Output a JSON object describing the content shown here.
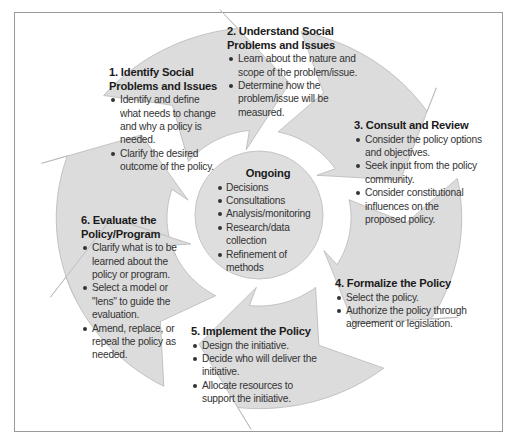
{
  "diagram": {
    "colors": {
      "arrow_fill": "#dcdcdc",
      "arrow_stroke": "#b8b8b8",
      "center_fill": "#dedede",
      "frame_border": "#9a9a9a",
      "text": "#333333",
      "heading": "#1a1a1a"
    },
    "center": {
      "title": "Ongoing",
      "items": [
        "Decisions",
        "Consultations",
        "Analysis/monitoring",
        "Research/data collection",
        "Refinement of methods"
      ]
    },
    "steps": [
      {
        "title": "1. Identify Social Problems and Issues",
        "items": [
          "Identify and define what needs to change and why a policy is needed.",
          "Clarify the desired outcome of the policy."
        ]
      },
      {
        "title": "2. Understand Social Problems and Issues",
        "items": [
          "Learn about the nature and scope of the problem/issue.",
          "Determine how the problem/issue will be measured."
        ]
      },
      {
        "title": "3. Consult and Review",
        "items": [
          "Consider the policy options and objectives.",
          "Seek input from the policy community.",
          "Consider constitutional influences on the proposed policy."
        ]
      },
      {
        "title": "4. Formalize the Policy",
        "items": [
          "Select the policy.",
          "Authorize the policy through agreement or legislation."
        ]
      },
      {
        "title": "5. Implement the Policy",
        "items": [
          "Design the initiative.",
          "Decide who will deliver the initiative.",
          "Allocate resources to support the initiative."
        ]
      },
      {
        "title": "6. Evaluate the Policy/Program",
        "items": [
          "Clarify what is to be learned about the policy or program.",
          "Select a model or \"lens\" to guide the evaluation.",
          "Amend, replace, or repeal the policy as needed."
        ]
      }
    ]
  }
}
